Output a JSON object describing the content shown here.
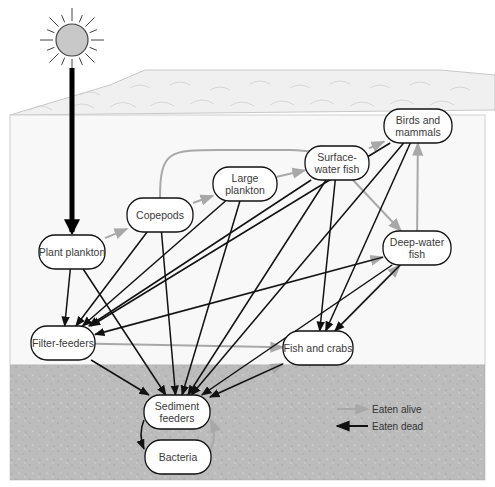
{
  "diagram": {
    "colors": {
      "sun_fill": "#c8c8c8",
      "sun_stroke": "#444444",
      "sky": "#ffffff",
      "water": "#f7f7f7",
      "surface": "#f0f0f0",
      "sediment": "#bdbdbd",
      "eaten_alive": "#a8a8a8",
      "eaten_dead": "#111111",
      "node_fill": "#ffffff",
      "node_stroke": "#111111"
    },
    "nodes": [
      {
        "id": "plant_plankton",
        "lines": [
          "Plant plankton"
        ],
        "x": 72,
        "y": 252,
        "w": 66,
        "h": 34
      },
      {
        "id": "copepods",
        "lines": [
          "Copepods"
        ],
        "x": 160,
        "y": 215,
        "w": 66,
        "h": 34
      },
      {
        "id": "large_plankton",
        "lines": [
          "Large",
          "plankton"
        ],
        "x": 245,
        "y": 184,
        "w": 64,
        "h": 34
      },
      {
        "id": "surface_water_fish",
        "lines": [
          "Surface-",
          "water fish"
        ],
        "x": 337,
        "y": 163,
        "w": 64,
        "h": 34
      },
      {
        "id": "birds_and_mammals",
        "lines": [
          "Birds and",
          "mammals"
        ],
        "x": 418,
        "y": 126,
        "w": 68,
        "h": 34
      },
      {
        "id": "deep_water_fish",
        "lines": [
          "Deep-water",
          "fish"
        ],
        "x": 417,
        "y": 248,
        "w": 68,
        "h": 34
      },
      {
        "id": "filter_feeders",
        "lines": [
          "Filter-feeders"
        ],
        "x": 63,
        "y": 343,
        "w": 64,
        "h": 34
      },
      {
        "id": "fish_and_crabs",
        "lines": [
          "Fish and crabs"
        ],
        "x": 318,
        "y": 348,
        "w": 70,
        "h": 34
      },
      {
        "id": "sediment_feeders",
        "lines": [
          "Sediment",
          "feeders"
        ],
        "x": 177,
        "y": 412,
        "w": 66,
        "h": 34
      },
      {
        "id": "bacteria",
        "lines": [
          "Bacteria"
        ],
        "x": 178,
        "y": 457,
        "w": 66,
        "h": 34
      }
    ],
    "edges_eaten_alive": [
      [
        "plant_plankton",
        "copepods"
      ],
      [
        "copepods",
        "large_plankton"
      ],
      [
        "copepods",
        "surface_water_fish"
      ],
      [
        "large_plankton",
        "surface_water_fish"
      ],
      [
        "surface_water_fish",
        "birds_and_mammals"
      ],
      [
        "surface_water_fish",
        "deep_water_fish"
      ],
      [
        "deep_water_fish",
        "birds_and_mammals"
      ],
      [
        "filter_feeders",
        "fish_and_crabs"
      ],
      [
        "filter_feeders",
        "deep_water_fish"
      ],
      [
        "fish_and_crabs",
        "deep_water_fish"
      ],
      [
        "sediment_feeders",
        "fish_and_crabs"
      ],
      [
        "bacteria",
        "sediment_feeders"
      ]
    ],
    "edges_eaten_dead": [
      [
        "plant_plankton",
        "filter_feeders"
      ],
      [
        "plant_plankton",
        "sediment_feeders"
      ],
      [
        "copepods",
        "filter_feeders"
      ],
      [
        "copepods",
        "sediment_feeders"
      ],
      [
        "large_plankton",
        "filter_feeders"
      ],
      [
        "large_plankton",
        "sediment_feeders"
      ],
      [
        "surface_water_fish",
        "filter_feeders"
      ],
      [
        "surface_water_fish",
        "sediment_feeders"
      ],
      [
        "surface_water_fish",
        "fish_and_crabs"
      ],
      [
        "birds_and_mammals",
        "filter_feeders"
      ],
      [
        "birds_and_mammals",
        "sediment_feeders"
      ],
      [
        "birds_and_mammals",
        "fish_and_crabs"
      ],
      [
        "deep_water_fish",
        "filter_feeders"
      ],
      [
        "deep_water_fish",
        "sediment_feeders"
      ],
      [
        "deep_water_fish",
        "fish_and_crabs"
      ],
      [
        "filter_feeders",
        "sediment_feeders"
      ],
      [
        "fish_and_crabs",
        "sediment_feeders"
      ],
      [
        "sediment_feeders",
        "bacteria"
      ]
    ],
    "sunlight_arrow": {
      "from": [
        72,
        68
      ],
      "to": [
        72,
        232
      ]
    },
    "legend": {
      "eaten_alive_label": "Eaten alive",
      "eaten_dead_label": "Eaten dead"
    }
  }
}
